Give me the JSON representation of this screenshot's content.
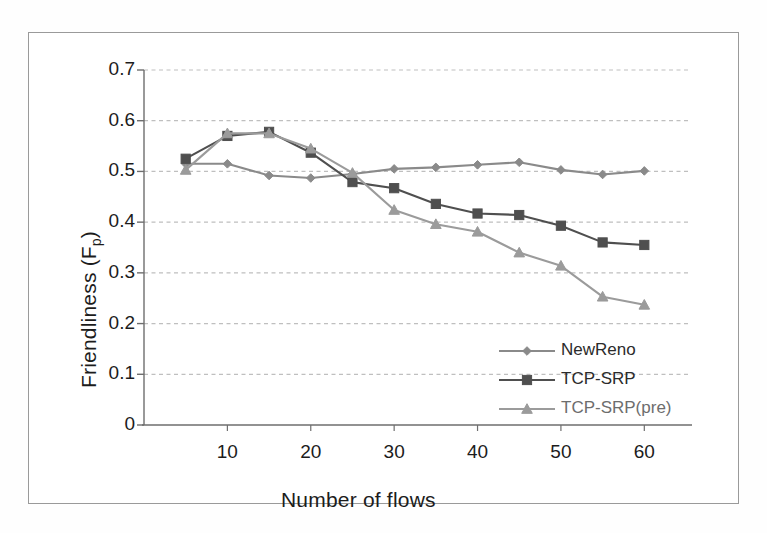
{
  "figure": {
    "y_axis_title_main": "Friendliness (F",
    "y_axis_title_sub": "p",
    "y_axis_title_close": ")",
    "x_axis_title": "Number of flows"
  },
  "chart_data": {
    "type": "line",
    "title": "",
    "xlabel": "Number of flows",
    "ylabel": "Friendliness (Fp)",
    "xlim": [
      0,
      65
    ],
    "ylim": [
      0,
      0.7
    ],
    "grid": true,
    "grid_axis": "y",
    "legend_position": "inside-bottom-right",
    "x": [
      5,
      10,
      15,
      20,
      25,
      30,
      35,
      40,
      45,
      50,
      55,
      60
    ],
    "xticks": [
      10,
      20,
      30,
      40,
      50,
      60
    ],
    "xtick_labels": [
      "10",
      "20",
      "30",
      "40",
      "50",
      "60"
    ],
    "yticks": [
      0,
      0.1,
      0.2,
      0.3,
      0.4,
      0.5,
      0.6,
      0.7
    ],
    "ytick_labels": [
      "0",
      "0.1",
      "0.2",
      "0.3",
      "0.4",
      "0.5",
      "0.6",
      "0.7"
    ],
    "series": [
      {
        "name": "NewReno",
        "marker": "diamond",
        "color": "#8a8a8a",
        "values": [
          0.515,
          0.515,
          0.492,
          0.487,
          0.495,
          0.505,
          0.508,
          0.513,
          0.518,
          0.503,
          0.494,
          0.501
        ]
      },
      {
        "name": "TCP-SRP",
        "marker": "square",
        "color": "#4f4f4f",
        "values": [
          0.525,
          0.57,
          0.578,
          0.537,
          0.479,
          0.467,
          0.436,
          0.417,
          0.414,
          0.393,
          0.36,
          0.355
        ]
      },
      {
        "name": "TCP-SRP(pre)",
        "marker": "triangle",
        "color": "#9b9b9b",
        "values": [
          0.503,
          0.575,
          0.575,
          0.545,
          0.497,
          0.424,
          0.396,
          0.381,
          0.34,
          0.314,
          0.253,
          0.237
        ]
      }
    ]
  },
  "legend": {
    "items": [
      {
        "label": "NewReno"
      },
      {
        "label": "TCP-SRP"
      },
      {
        "label": "TCP-SRP(pre)"
      }
    ]
  }
}
